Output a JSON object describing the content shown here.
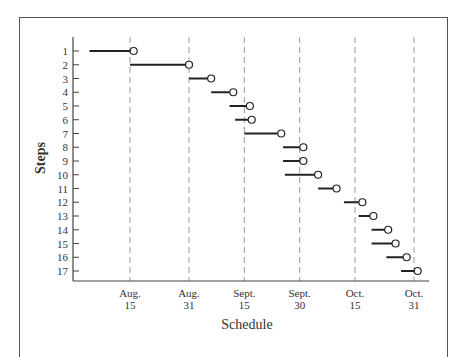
{
  "chart_data": {
    "type": "gantt",
    "title": "",
    "xlabel": "Schedule",
    "ylabel": "Steps",
    "x_axis": {
      "unit": "day (Aug 1 = 1)",
      "ticks": [
        {
          "label_top": "Aug.",
          "label_bottom": "15",
          "day": 15
        },
        {
          "label_top": "Aug.",
          "label_bottom": "31",
          "day": 31
        },
        {
          "label_top": "Sept.",
          "label_bottom": "15",
          "day": 46
        },
        {
          "label_top": "Sept.",
          "label_bottom": "30",
          "day": 61
        },
        {
          "label_top": "Oct.",
          "label_bottom": "15",
          "day": 76
        },
        {
          "label_top": "Oct.",
          "label_bottom": "31",
          "day": 92
        }
      ],
      "gridlines": "dashed vertical at each tick"
    },
    "y_axis": {
      "categories": [
        "1",
        "2",
        "3",
        "4",
        "5",
        "6",
        "7",
        "8",
        "9",
        "10",
        "11",
        "12",
        "13",
        "14",
        "15",
        "16",
        "17"
      ],
      "inverted": true
    },
    "series": [
      {
        "name": "Steps",
        "values": [
          {
            "step": "1",
            "start": 4,
            "end": 16
          },
          {
            "step": "2",
            "start": 15,
            "end": 31
          },
          {
            "step": "3",
            "start": 31,
            "end": 37
          },
          {
            "step": "4",
            "start": 37,
            "end": 43
          },
          {
            "step": "5",
            "start": 42,
            "end": 47.5
          },
          {
            "step": "6",
            "start": 43.5,
            "end": 48
          },
          {
            "step": "7",
            "start": 46,
            "end": 56
          },
          {
            "step": "8",
            "start": 56.5,
            "end": 62
          },
          {
            "step": "9",
            "start": 56.5,
            "end": 62
          },
          {
            "step": "10",
            "start": 57,
            "end": 66
          },
          {
            "step": "11",
            "start": 66,
            "end": 71
          },
          {
            "step": "12",
            "start": 73,
            "end": 78
          },
          {
            "step": "13",
            "start": 77,
            "end": 81
          },
          {
            "step": "14",
            "start": 80.5,
            "end": 85
          },
          {
            "step": "15",
            "start": 80.5,
            "end": 87
          },
          {
            "step": "16",
            "start": 84.5,
            "end": 90
          },
          {
            "step": "17",
            "start": 88.5,
            "end": 93
          }
        ]
      }
    ],
    "marker": "open circle at end of each bar",
    "grid": false,
    "legend": "none"
  },
  "labels": {
    "xlabel": "Schedule",
    "ylabel": "Steps"
  },
  "colors": {
    "bar": "#222222",
    "gridline": "#999999",
    "axis": "#444444",
    "frame": "#555555"
  }
}
